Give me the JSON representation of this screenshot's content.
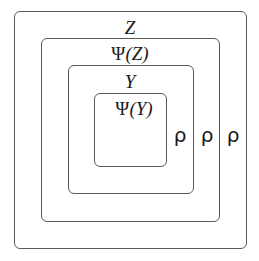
{
  "diagram": {
    "type": "nested-sets",
    "stroke_color": "#5a5a5a",
    "boxes": [
      {
        "id": "Z",
        "label": "Z",
        "level": 1
      },
      {
        "id": "PsiZ",
        "label": "Ψ(Z)",
        "level": 2
      },
      {
        "id": "Y",
        "label": "Y",
        "level": 3
      },
      {
        "id": "PsiY",
        "label": "Ψ(Y)",
        "level": 4
      }
    ],
    "labels": {
      "z": "Z",
      "psi_z_psi": "Ψ",
      "psi_z_arg": "(Z)",
      "y": "Y",
      "psi_y_psi": "Ψ",
      "psi_y_arg": "(Y)"
    },
    "rho_labels": [
      "ρ",
      "ρ",
      "ρ"
    ]
  }
}
